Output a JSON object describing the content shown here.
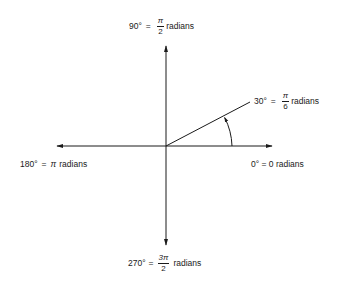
{
  "diagram": {
    "type": "angle-radian-reference",
    "origin": [
      166,
      146
    ],
    "axes": {
      "x_left_tip": [
        57,
        146
      ],
      "x_right_tip": [
        272,
        146
      ],
      "y_top_tip": [
        166,
        46
      ],
      "y_bottom_tip": [
        166,
        245
      ]
    },
    "ray": {
      "angle_deg": 30,
      "end": [
        250,
        102
      ]
    },
    "arc": {
      "radius": 66,
      "from_deg": 0,
      "to_deg": 30
    },
    "stroke_color": "#1a1a1a"
  },
  "labels": {
    "top": {
      "deg": "90°",
      "eq": "=",
      "num": "π",
      "den": "2",
      "unit": "radians"
    },
    "ray": {
      "deg": "30°",
      "eq": "=",
      "num": "π",
      "den": "6",
      "unit": "radians"
    },
    "left": {
      "deg": "180°",
      "eq": "=",
      "pi": "π",
      "unit": "radians"
    },
    "right": {
      "text": "0° = 0 radians"
    },
    "bottom": {
      "deg": "270°",
      "eq": "=",
      "num": "3π",
      "den": "2",
      "unit": "radians"
    }
  }
}
